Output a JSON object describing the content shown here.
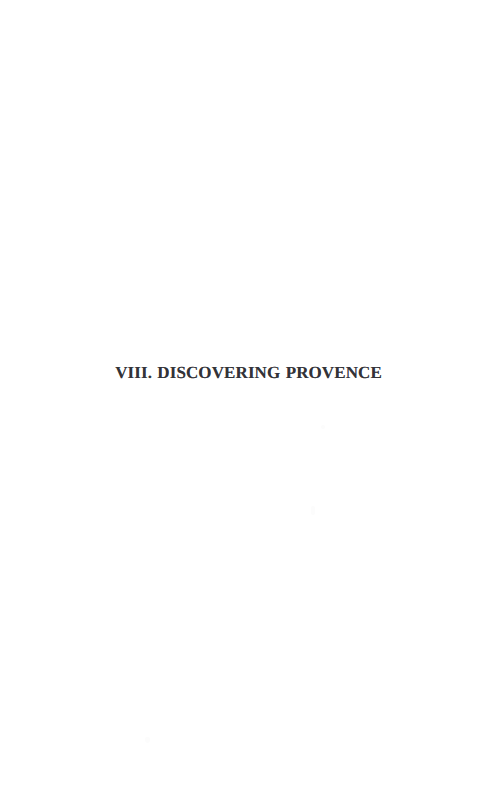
{
  "page": {
    "background_color": "#ffffff",
    "width": 497,
    "height": 811,
    "kind": "scanned-book-chapter-divider"
  },
  "chapter": {
    "number_label": "VIII.",
    "title_label": "DISCOVERING PROVENCE",
    "full_heading": "VIII. DISCOVERING PROVENCE",
    "ink_color": "#333338"
  },
  "artifacts": {
    "speck_a_label": "",
    "speck_b_label": "",
    "speck_c_label": ""
  }
}
